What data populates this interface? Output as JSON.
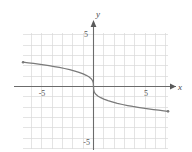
{
  "figure": {
    "name": "coordinate-plane-graph",
    "width": 192,
    "height": 152,
    "background": "#ffffff"
  },
  "axes": {
    "x_axis_label": "x",
    "y_axis_label": "y",
    "x_tick_labels": [
      {
        "value": -5,
        "text": "-5"
      },
      {
        "value": 5,
        "text": "5"
      }
    ],
    "y_tick_labels": [
      {
        "value": 5,
        "text": "5"
      },
      {
        "value": -5,
        "text": "-5"
      }
    ],
    "axis_color": "#6b6b6b",
    "grid_color": "#d6d6d6",
    "grid": true,
    "xlim": [
      -7,
      7.2
    ],
    "ylim": [
      -6,
      5.2
    ],
    "x_arrow": "right",
    "y_arrow": "up"
  },
  "chart_data": {
    "type": "line",
    "title": "",
    "xlabel": "x",
    "ylabel": "y",
    "xlim": [
      -7,
      7.2
    ],
    "ylim": [
      -6,
      5.2
    ],
    "grid": true,
    "legend": false,
    "curve_color": "#7a7a7a",
    "series": [
      {
        "name": "y = -cbrt(x)",
        "x": [
          -6.8,
          -6.3,
          -5.8,
          -5.3,
          -4.8,
          -4.3,
          -3.8,
          -3.3,
          -2.8,
          -2.3,
          -1.8,
          -1.4,
          -1.0,
          -0.7,
          -0.45,
          -0.25,
          -0.12,
          -0.05,
          -0.015,
          0.0,
          0.015,
          0.05,
          0.12,
          0.25,
          0.45,
          0.7,
          1.0,
          1.4,
          1.8,
          2.3,
          2.8,
          3.3,
          3.8,
          4.3,
          4.8,
          5.3,
          5.8,
          6.3,
          6.8,
          7.2
        ],
        "y": [
          2.35,
          2.29,
          2.23,
          2.16,
          2.09,
          2.01,
          1.93,
          1.84,
          1.74,
          1.63,
          1.49,
          1.37,
          1.22,
          1.08,
          0.94,
          0.78,
          0.61,
          0.45,
          0.3,
          0.0,
          -0.3,
          -0.45,
          -0.61,
          -0.78,
          -0.94,
          -1.08,
          -1.22,
          -1.37,
          -1.49,
          -1.63,
          -1.74,
          -1.84,
          -1.93,
          -2.01,
          -2.09,
          -2.16,
          -2.23,
          -2.29,
          -2.35,
          -2.4
        ]
      }
    ]
  }
}
